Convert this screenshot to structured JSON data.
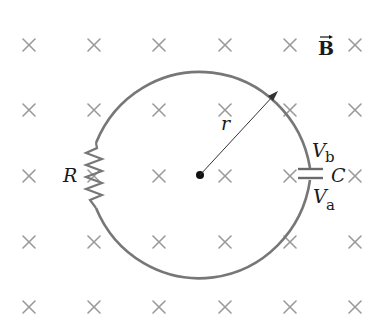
{
  "diagram": {
    "type": "circuit-in-magnetic-field",
    "field": {
      "label": "B",
      "vector_arrow": true,
      "direction": "into-page",
      "symbol": "×",
      "color": "#9a9a9a",
      "grid_cols_x": [
        29,
        94,
        159,
        225,
        290,
        355
      ],
      "grid_rows_y": [
        45,
        110,
        176,
        242,
        307
      ]
    },
    "loop": {
      "shape": "circle",
      "center": [
        200,
        174
      ],
      "radius": 114,
      "wire_color": "#777777"
    },
    "components": {
      "resistor": {
        "label": "R"
      },
      "capacitor": {
        "label": "C",
        "top_terminal_label": "V",
        "top_terminal_sub": "b",
        "bottom_terminal_label": "V",
        "bottom_terminal_sub": "a"
      }
    },
    "radius_label": "r"
  }
}
